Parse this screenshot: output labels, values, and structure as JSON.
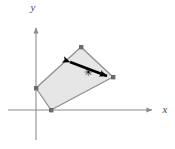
{
  "figure": {
    "background_color": "#ffffff",
    "width": 175,
    "height": 149
  },
  "axes": {
    "x_axis": {
      "label": "x",
      "label_x": 165,
      "label_y": 113,
      "color": "#8c8c8c",
      "start_x": 8,
      "end_x": 158,
      "y": 110
    },
    "y_axis": {
      "label": "y",
      "label_x": 33,
      "label_y": 11,
      "color": "#8c8c8c",
      "x": 36,
      "start_y": 140,
      "end_y": 22
    }
  },
  "shape": {
    "name": "quadrilateral",
    "fill_color": "#e6e6e6",
    "stroke_color": "#8f8f8f",
    "points": "81,47 113,77 51,110 36,88",
    "vertices": [
      {
        "name": "top-vertex",
        "x": 81,
        "y": 47
      },
      {
        "name": "right-vertex",
        "x": 113,
        "y": 77
      },
      {
        "name": "bottom-vertex",
        "x": 51,
        "y": 110
      },
      {
        "name": "left-vertex",
        "x": 36,
        "y": 88
      }
    ],
    "vertex_marker_color": "#6b6b6b",
    "vertex_marker_size": 4
  },
  "annotation": {
    "arrow": {
      "name": "double-headed-arrow",
      "color": "#000000",
      "tail_x": 63,
      "tail_y": 59,
      "head_x": 114,
      "head_y": 78,
      "stroke_width": 2.6
    },
    "center_mark": {
      "symbol": "✳",
      "x": 88,
      "y": 72,
      "color": "#000000",
      "size": 11
    }
  }
}
